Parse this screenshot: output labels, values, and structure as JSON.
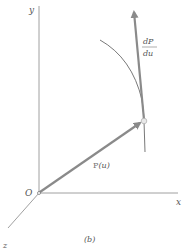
{
  "figure": {
    "caption": "(b)",
    "axes": {
      "x_label": "x",
      "y_label": "y",
      "z_label": "z",
      "origin_label": "O"
    },
    "position_vector": {
      "label_base": "P",
      "label_arg": "(u)"
    },
    "tangent_vector": {
      "numerator": "dP",
      "denominator": "du"
    },
    "colors": {
      "axis": "#777777",
      "vector": "#8a8a8a",
      "curve": "#555555",
      "text": "#666666"
    }
  }
}
